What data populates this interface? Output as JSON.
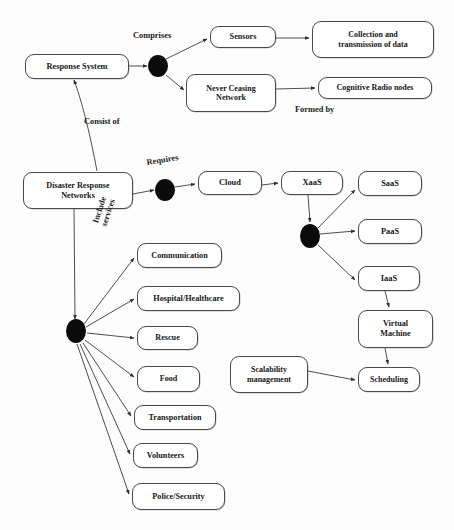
{
  "diagram": {
    "type": "flow-diagram",
    "canvas": {
      "width": 454,
      "height": 530
    },
    "colors": {
      "node_border": "#4a4a4a",
      "node_fill": "#ffffff",
      "merge_node": "#0b0b0b",
      "edge": "#3a3a3a",
      "text": "#171717",
      "background": "#ffffff"
    },
    "nodes": [
      {
        "id": "response-system",
        "label": "Response System",
        "x": 25,
        "y": 54,
        "w": 104,
        "h": 25,
        "font": 8.4
      },
      {
        "id": "sensors",
        "label": "Sensors",
        "x": 210,
        "y": 26,
        "w": 66,
        "h": 22,
        "font": 8.2
      },
      {
        "id": "collection-transmission",
        "label": "Collection and\ntransmission of data",
        "x": 312,
        "y": 21,
        "w": 122,
        "h": 37,
        "font": 8.0
      },
      {
        "id": "never-ceasing-network",
        "label": "Never Ceasing\nNetwork",
        "x": 186,
        "y": 74,
        "w": 90,
        "h": 38,
        "font": 8.0
      },
      {
        "id": "cognitive-radio-nodes",
        "label": "Cognitive Radio nodes",
        "x": 318,
        "y": 77,
        "w": 114,
        "h": 22,
        "font": 8.0
      },
      {
        "id": "disaster-response-networks",
        "label": "Disaster Response\nNetworks",
        "x": 23,
        "y": 172,
        "w": 110,
        "h": 37,
        "font": 8.2
      },
      {
        "id": "cloud",
        "label": "Cloud",
        "x": 198,
        "y": 171,
        "w": 64,
        "h": 24,
        "font": 8.4
      },
      {
        "id": "xaas",
        "label": "XaaS",
        "x": 281,
        "y": 171,
        "w": 62,
        "h": 24,
        "font": 8.4
      },
      {
        "id": "saas",
        "label": "SaaS",
        "x": 358,
        "y": 171,
        "w": 64,
        "h": 25,
        "font": 8.4
      },
      {
        "id": "paas",
        "label": "PaaS",
        "x": 358,
        "y": 219,
        "w": 64,
        "h": 25,
        "font": 8.4
      },
      {
        "id": "iaas",
        "label": "IaaS",
        "x": 358,
        "y": 266,
        "w": 62,
        "h": 25,
        "font": 8.4
      },
      {
        "id": "virtual-machine",
        "label": "Virtual\nMachine",
        "x": 358,
        "y": 310,
        "w": 75,
        "h": 38,
        "font": 8.2
      },
      {
        "id": "scheduling",
        "label": "Scheduling",
        "x": 358,
        "y": 367,
        "w": 62,
        "h": 25,
        "font": 8.0
      },
      {
        "id": "scalability-management",
        "label": "Scalability\nmanagement",
        "x": 230,
        "y": 356,
        "w": 78,
        "h": 37,
        "font": 8.0
      },
      {
        "id": "communication",
        "label": "Communication",
        "x": 137,
        "y": 243,
        "w": 85,
        "h": 25,
        "font": 8.2
      },
      {
        "id": "hospital-healthcare",
        "label": "Hospital/Healthcare",
        "x": 137,
        "y": 286,
        "w": 103,
        "h": 25,
        "font": 8.2
      },
      {
        "id": "rescue",
        "label": "Rescue",
        "x": 137,
        "y": 326,
        "w": 61,
        "h": 24,
        "font": 8.2
      },
      {
        "id": "food",
        "label": "Food",
        "x": 137,
        "y": 366,
        "w": 63,
        "h": 26,
        "font": 8.2
      },
      {
        "id": "transportation",
        "label": "Transportation",
        "x": 134,
        "y": 405,
        "w": 82,
        "h": 25,
        "font": 8.2
      },
      {
        "id": "volunteers",
        "label": "Volunteers",
        "x": 133,
        "y": 443,
        "w": 65,
        "h": 25,
        "font": 8.2
      },
      {
        "id": "police-security",
        "label": "Police/Security",
        "x": 132,
        "y": 483,
        "w": 93,
        "h": 27,
        "font": 8.2
      }
    ],
    "merge_nodes": [
      {
        "id": "merge-comprises",
        "cx": 158,
        "cy": 66,
        "rx": 10,
        "ry": 11
      },
      {
        "id": "merge-requires",
        "cx": 165,
        "cy": 190,
        "rx": 10,
        "ry": 11
      },
      {
        "id": "merge-xaas",
        "cx": 310,
        "cy": 236,
        "rx": 10,
        "ry": 12
      },
      {
        "id": "merge-services",
        "cx": 76,
        "cy": 331,
        "rx": 10,
        "ry": 12
      }
    ],
    "edge_labels": [
      {
        "id": "comprises",
        "text": "Comprises",
        "x": 133,
        "y": 31,
        "font": 8.4,
        "rotate": 0
      },
      {
        "id": "formed-by",
        "text": "Formed by",
        "x": 295,
        "y": 105,
        "font": 8.4,
        "rotate": 0
      },
      {
        "id": "consist-of",
        "text": "Consist of",
        "x": 84,
        "y": 117,
        "font": 8.4,
        "rotate": 0
      },
      {
        "id": "requires",
        "text": "Requires",
        "x": 146,
        "y": 158,
        "font": 8.4,
        "rotate": -9
      },
      {
        "id": "include-services",
        "text": "Include\nservices",
        "x": 96,
        "y": 216,
        "font": 8.4,
        "rotate": -72
      }
    ],
    "edges": [
      {
        "from": "response-system",
        "to": "merge-comprises",
        "label": ""
      },
      {
        "from": "merge-comprises",
        "to": "sensors",
        "label": "Comprises"
      },
      {
        "from": "merge-comprises",
        "to": "never-ceasing-network",
        "label": "Comprises"
      },
      {
        "from": "sensors",
        "to": "collection-transmission",
        "label": ""
      },
      {
        "from": "never-ceasing-network",
        "to": "cognitive-radio-nodes",
        "label": "Formed by"
      },
      {
        "from": "disaster-response-networks",
        "to": "response-system",
        "label": "Consist of"
      },
      {
        "from": "disaster-response-networks",
        "to": "merge-requires",
        "label": "Requires"
      },
      {
        "from": "merge-requires",
        "to": "cloud",
        "label": ""
      },
      {
        "from": "cloud",
        "to": "xaas",
        "label": ""
      },
      {
        "from": "xaas",
        "to": "merge-xaas",
        "label": ""
      },
      {
        "from": "merge-xaas",
        "to": "saas",
        "label": ""
      },
      {
        "from": "merge-xaas",
        "to": "paas",
        "label": ""
      },
      {
        "from": "merge-xaas",
        "to": "iaas",
        "label": ""
      },
      {
        "from": "iaas",
        "to": "virtual-machine",
        "label": ""
      },
      {
        "from": "virtual-machine",
        "to": "scheduling",
        "label": ""
      },
      {
        "from": "scalability-management",
        "to": "scheduling",
        "label": ""
      },
      {
        "from": "disaster-response-networks",
        "to": "merge-services",
        "label": "Include services"
      },
      {
        "from": "merge-services",
        "to": "communication",
        "label": ""
      },
      {
        "from": "merge-services",
        "to": "hospital-healthcare",
        "label": ""
      },
      {
        "from": "merge-services",
        "to": "rescue",
        "label": ""
      },
      {
        "from": "merge-services",
        "to": "food",
        "label": ""
      },
      {
        "from": "merge-services",
        "to": "transportation",
        "label": ""
      },
      {
        "from": "merge-services",
        "to": "volunteers",
        "label": ""
      },
      {
        "from": "merge-services",
        "to": "police-security",
        "label": ""
      }
    ]
  }
}
